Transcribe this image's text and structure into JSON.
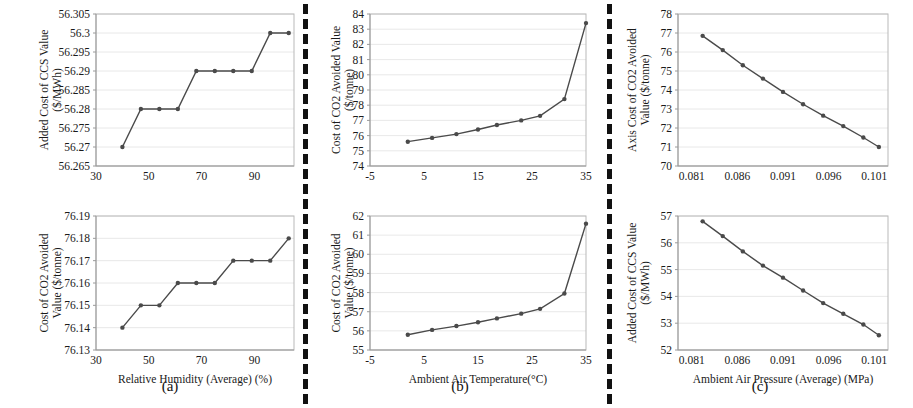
{
  "figure": {
    "panel_captions": [
      "(a)",
      "(b)",
      "(c)"
    ],
    "line_color": "#4a4a4a",
    "grid_color": "#e2e2e2",
    "divider_color": "#111111"
  },
  "chart_data": [
    {
      "id": "a-top",
      "type": "line",
      "title": "",
      "xlabel": "",
      "ylabel": "Added Cost of CCS Value ($/MWh)",
      "xlim": [
        30,
        105
      ],
      "ylim": [
        56.265,
        56.305
      ],
      "xticks": [
        30,
        50,
        70,
        90
      ],
      "yticks": [
        56.265,
        56.27,
        56.275,
        56.28,
        56.285,
        56.29,
        56.295,
        56.3,
        56.305
      ],
      "ytick_labels": [
        "56.265",
        "56.27",
        "56.275",
        "56.28",
        "56.285",
        "56.29",
        "56.295",
        "56.3",
        "56.305"
      ],
      "grid": true,
      "legend": "none",
      "x": [
        40,
        47,
        54,
        61,
        68,
        75,
        82,
        89,
        96,
        103
      ],
      "values": [
        56.27,
        56.28,
        56.28,
        56.28,
        56.29,
        56.29,
        56.29,
        56.29,
        56.3,
        56.3
      ]
    },
    {
      "id": "a-bottom",
      "type": "line",
      "title": "",
      "xlabel": "Relative Humidity (Average) (%)",
      "ylabel": "Cost of CO2 Avoided Value ($/tonne)",
      "xlim": [
        30,
        105
      ],
      "ylim": [
        76.13,
        76.19
      ],
      "xticks": [
        30,
        50,
        70,
        90
      ],
      "yticks": [
        76.13,
        76.14,
        76.15,
        76.16,
        76.17,
        76.18,
        76.19
      ],
      "ytick_labels": [
        "76.13",
        "76.14",
        "76.15",
        "76.16",
        "76.17",
        "76.18",
        "76.19"
      ],
      "grid": true,
      "legend": "none",
      "x": [
        40,
        47,
        54,
        61,
        68,
        75,
        82,
        89,
        96,
        103
      ],
      "values": [
        76.14,
        76.15,
        76.15,
        76.16,
        76.16,
        76.16,
        76.17,
        76.17,
        76.17,
        76.18
      ]
    },
    {
      "id": "b-top",
      "type": "line",
      "title": "",
      "xlabel": "",
      "ylabel": "Cost of CO2 Avoided Value ($/tonne)",
      "xlim": [
        -5,
        35
      ],
      "ylim": [
        74,
        84
      ],
      "xticks": [
        -5,
        5,
        15,
        25,
        35
      ],
      "yticks": [
        74,
        75,
        76,
        77,
        78,
        79,
        80,
        81,
        82,
        83,
        84
      ],
      "ytick_labels": [
        "74",
        "75",
        "76",
        "77",
        "78",
        "79",
        "80",
        "81",
        "82",
        "83",
        "84"
      ],
      "grid": true,
      "legend": "none",
      "x": [
        2,
        6.5,
        11,
        15,
        18.5,
        23,
        26.5,
        31,
        35
      ],
      "values": [
        75.6,
        75.85,
        76.1,
        76.4,
        76.7,
        77.0,
        77.3,
        78.4,
        83.4
      ]
    },
    {
      "id": "b-bottom",
      "type": "line",
      "title": "",
      "xlabel": "Ambient Air Temperature(°C)",
      "ylabel": "Cost of CO2 Avoided Value ($/tonne)",
      "xlim": [
        -5,
        35
      ],
      "ylim": [
        55,
        62
      ],
      "xticks": [
        -5,
        5,
        15,
        25,
        35
      ],
      "yticks": [
        55,
        56,
        57,
        58,
        59,
        60,
        61,
        62
      ],
      "ytick_labels": [
        "55",
        "56",
        "57",
        "58",
        "59",
        "60",
        "61",
        "62"
      ],
      "grid": true,
      "legend": "none",
      "x": [
        2,
        6.5,
        11,
        15,
        18.5,
        23,
        26.5,
        31,
        35
      ],
      "values": [
        55.8,
        56.05,
        56.25,
        56.45,
        56.65,
        56.9,
        57.15,
        57.95,
        61.6
      ]
    },
    {
      "id": "c-top",
      "type": "line",
      "title": "",
      "xlabel": "",
      "ylabel": "Axis Cost of CO2 Avoided Value ($/tonne)",
      "xlim": [
        0.0795,
        0.1025
      ],
      "ylim": [
        70,
        78
      ],
      "xticks": [
        0.081,
        0.086,
        0.091,
        0.096,
        0.101
      ],
      "xtick_labels": [
        "0.081",
        "0.086",
        "0.091",
        "0.096",
        "0.101"
      ],
      "yticks": [
        70,
        71,
        72,
        73,
        74,
        75,
        76,
        77,
        78
      ],
      "ytick_labels": [
        "70",
        "71",
        "72",
        "73",
        "74",
        "75",
        "76",
        "77",
        "78"
      ],
      "grid": true,
      "legend": "none",
      "x": [
        0.0822,
        0.0844,
        0.0866,
        0.0888,
        0.091,
        0.0932,
        0.0954,
        0.0976,
        0.0998,
        0.1015
      ],
      "values": [
        76.85,
        76.1,
        75.3,
        74.6,
        73.9,
        73.25,
        72.65,
        72.1,
        71.5,
        71.0
      ]
    },
    {
      "id": "c-bottom",
      "type": "line",
      "title": "",
      "xlabel": "Ambient Air Pressure (Average) (MPa)",
      "ylabel": "Added Cost of CCS Value ($/MWh)",
      "xlim": [
        0.0795,
        0.1025
      ],
      "ylim": [
        52,
        57
      ],
      "xticks": [
        0.081,
        0.086,
        0.091,
        0.096,
        0.101
      ],
      "xtick_labels": [
        "0.081",
        "0.086",
        "0.091",
        "0.096",
        "0.101"
      ],
      "yticks": [
        52,
        53,
        54,
        55,
        56,
        57
      ],
      "ytick_labels": [
        "52",
        "53",
        "54",
        "55",
        "56",
        "57"
      ],
      "grid": true,
      "legend": "none",
      "x": [
        0.0822,
        0.0844,
        0.0866,
        0.0888,
        0.091,
        0.0932,
        0.0954,
        0.0976,
        0.0998,
        0.1015
      ],
      "values": [
        56.8,
        56.25,
        55.68,
        55.15,
        54.7,
        54.22,
        53.75,
        53.35,
        52.95,
        52.55
      ]
    }
  ]
}
